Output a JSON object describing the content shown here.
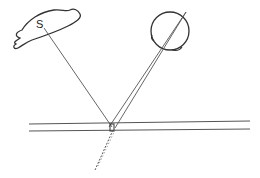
{
  "diagram": {
    "type": "ray-reflection-diagram",
    "source": {
      "label": "S",
      "shape": "blob",
      "label_pos": [
        40,
        19
      ]
    },
    "eye": {
      "shape": "circle",
      "center": [
        170,
        31
      ],
      "radius": 19
    },
    "pane": {
      "lines_y": [
        124,
        131
      ],
      "x_start": 29,
      "x_end": 250
    },
    "rays": [
      {
        "name": "incident-ray",
        "from": [
          44,
          28
        ],
        "to": [
          112,
          127
        ]
      },
      {
        "name": "reflected-ray-a",
        "from": [
          186,
          12
        ],
        "to": [
          110,
          127
        ]
      },
      {
        "name": "reflected-ray-b",
        "from": [
          186,
          12
        ],
        "to": [
          116,
          127
        ]
      }
    ],
    "virtual_ray": {
      "from": [
        113,
        130
      ],
      "to": [
        95,
        170
      ],
      "style": "dashed"
    },
    "colors": {
      "stroke": "#333333",
      "ray": "#444444"
    }
  }
}
